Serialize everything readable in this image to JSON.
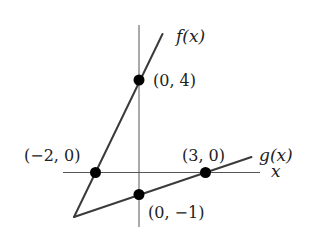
{
  "diagram": {
    "type": "function-graph",
    "axes": {
      "x_label": "x",
      "origin_px": [
        139,
        172.5
      ]
    },
    "functions": [
      {
        "name": "f",
        "label": "f(x)",
        "description": "line through (-2,0) and (0,4)"
      },
      {
        "name": "g",
        "label": "g(x)",
        "description": "line through (0,-1) and (3,0)"
      }
    ],
    "points": [
      {
        "label": "(0, 4)",
        "coords": [
          0,
          4
        ],
        "on": "f"
      },
      {
        "label": "(−2, 0)",
        "coords": [
          -2,
          0
        ],
        "on": "f"
      },
      {
        "label": "(3, 0)",
        "coords": [
          3,
          0
        ],
        "on": "g"
      },
      {
        "label": "(0, −1)",
        "coords": [
          0,
          -1
        ],
        "on": "g"
      }
    ],
    "labels": {
      "f": "f(x)",
      "g": "g(x)",
      "x": "x",
      "p_0_4": "(0, 4)",
      "p_m2_0": "(−2, 0)",
      "p_3_0": "(3, 0)",
      "p_0_m1": "(0, −1)"
    },
    "colors": {
      "lines": "#3a3a3a",
      "axes": "#555555",
      "points": "#000000"
    }
  }
}
